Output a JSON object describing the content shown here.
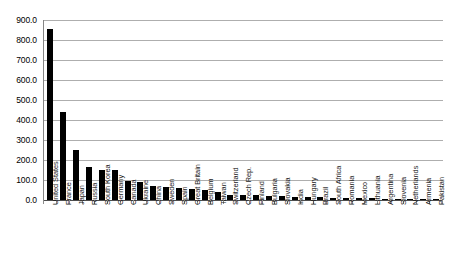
{
  "chart_data": {
    "type": "bar",
    "title": "",
    "subtitle": "",
    "xlabel": "",
    "ylabel": "",
    "ylim": [
      0,
      900
    ],
    "ytick_step": 100,
    "ytick_labels": [
      "900.0",
      "800.0",
      "700.0",
      "600.0",
      "500.0",
      "400.0",
      "300.0",
      "200.0",
      "100.0",
      "0.0"
    ],
    "ytick_values": [
      900,
      800,
      700,
      600,
      500,
      400,
      300,
      200,
      100,
      0
    ],
    "grid": true,
    "legend": "none",
    "bar_color": "#000000",
    "gridline_color": "#aeaeae",
    "axis_color": "#868686",
    "categories": [
      "United States",
      "France",
      "Japan",
      "Russia",
      "South Korea",
      "Germany",
      "Canada",
      "Ukraine",
      "China",
      "Sweden",
      "Spain",
      "Great Britain",
      "Belgium",
      "Taiwan",
      "Switzerland",
      "Czech Rep.",
      "Finland",
      "Bulgaria",
      "Slovakia",
      "India",
      "Hungary",
      "Brazil",
      "South Africa",
      "Romania",
      "Mexico",
      "Lithuania",
      "Argentina",
      "Slovenia",
      "Netherlands",
      "Armenia",
      "Pakistan"
    ],
    "values": [
      855.0,
      440.0,
      250.0,
      163.0,
      152.0,
      148.0,
      93.0,
      90.0,
      68.0,
      65.0,
      60.0,
      55.0,
      48.0,
      40.0,
      27.0,
      26.0,
      23.0,
      21.0,
      18.0,
      17.0,
      15.0,
      13.0,
      12.0,
      11.0,
      10.0,
      9.0,
      7.0,
      6.0,
      4.0,
      2.5,
      2.0
    ]
  }
}
